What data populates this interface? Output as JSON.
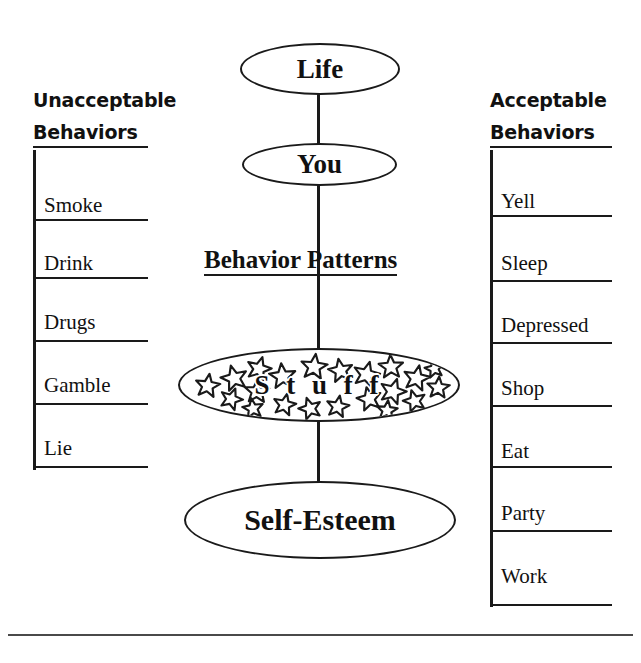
{
  "diagram": {
    "center_chain": {
      "life_label": "Life",
      "you_label": "You",
      "behavior_patterns_label": "Behavior Patterns",
      "stuff_label": "S t u f f",
      "self_esteem_label": "Self-Esteem"
    },
    "left_column": {
      "heading_line1": "Unacceptable",
      "heading_line2": "Behaviors",
      "items": [
        {
          "label": "Smoke"
        },
        {
          "label": "Drink"
        },
        {
          "label": "Drugs"
        },
        {
          "label": "Gamble"
        },
        {
          "label": "Lie"
        }
      ]
    },
    "right_column": {
      "heading_line1": "Acceptable",
      "heading_line2": "Behaviors",
      "items": [
        {
          "label": "Yell"
        },
        {
          "label": "Sleep"
        },
        {
          "label": "Depressed"
        },
        {
          "label": "Shop"
        },
        {
          "label": "Eat"
        },
        {
          "label": "Party"
        },
        {
          "label": "Work"
        }
      ]
    },
    "colors": {
      "ink": "#1a1a1a",
      "background": "#ffffff",
      "footer_rule": "#4a4a4a"
    }
  }
}
